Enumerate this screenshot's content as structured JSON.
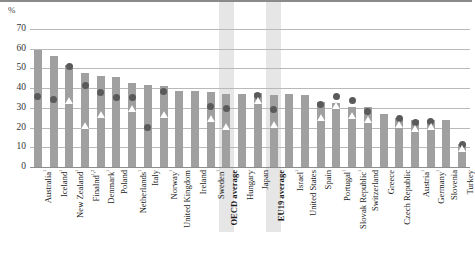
{
  "chart_data": {
    "type": "bar",
    "title": "",
    "xlabel": "",
    "ylabel": "%",
    "ylim": [
      0,
      70
    ],
    "yticks": [
      0,
      10,
      20,
      30,
      40,
      50,
      60,
      70
    ],
    "grid": true,
    "legend": "none",
    "categories": [
      "Australia¹",
      "Iceland¹",
      "New Zealand¹",
      "Finalnd¹,²",
      "Denmark¹",
      "Poland",
      "Netherlands¹",
      "Italy",
      "Norway¹",
      "United Kingdom",
      "Ireland",
      "Sweden¹",
      "OECD average",
      "Hungary",
      "Japan",
      "EU19 average",
      "Israel¹",
      "United States",
      "Spain",
      "Portugal¹",
      "Slovak Republic¹",
      "Switzerland",
      "Greece",
      "Czech Republic",
      "Austria¹",
      "Germany¹",
      "Slovenia",
      "Turkey"
    ],
    "highlighted_categories": [
      "OECD average",
      "EU19 average"
    ],
    "series": [
      {
        "name": "bar",
        "marker": "bar",
        "color": "#a0a0a0",
        "values": [
          59.5,
          56.5,
          52.0,
          47.5,
          46.0,
          45.5,
          42.5,
          41.5,
          41.0,
          38.5,
          38.5,
          38.0,
          37.0,
          37.0,
          37.5,
          36.5,
          37.0,
          36.5,
          33.0,
          32.5,
          30.5,
          30.5,
          27.0,
          25.0,
          24.0,
          24.0,
          24.0,
          11.5
        ]
      },
      {
        "name": "circle",
        "marker": "filled-circle",
        "color": "#5a5a5a",
        "values": [
          36.0,
          34.0,
          51.0,
          41.5,
          38.0,
          35.5,
          35.5,
          20.0,
          38.5,
          null,
          null,
          30.5,
          29.5,
          null,
          36.5,
          29.0,
          null,
          null,
          31.5,
          36.0,
          33.5,
          28.0,
          null,
          24.5,
          22.5,
          23.0,
          null,
          11.5
        ]
      },
      {
        "name": "triangle",
        "marker": "open-triangle",
        "color": "#ffffff",
        "values": [
          null,
          null,
          33.5,
          21.0,
          26.5,
          null,
          29.5,
          null,
          26.5,
          null,
          null,
          24.5,
          20.5,
          null,
          33.5,
          21.5,
          null,
          null,
          25.0,
          31.0,
          26.0,
          24.0,
          null,
          21.5,
          19.5,
          20.5,
          null,
          9.5
        ]
      }
    ]
  },
  "axis": {
    "unit_label": "%"
  }
}
